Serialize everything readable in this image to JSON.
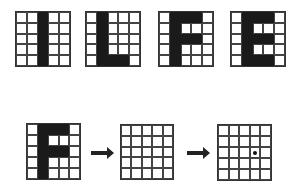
{
  "top_row": [
    {
      "letter": "I",
      "pattern": [
        "00100",
        "00100",
        "00100",
        "00100",
        "00100"
      ]
    },
    {
      "letter": "L",
      "pattern": [
        "01000",
        "01000",
        "01000",
        "01000",
        "01110"
      ]
    },
    {
      "letter": "F",
      "pattern": [
        "01110",
        "01000",
        "01110",
        "01000",
        "01000"
      ]
    },
    {
      "letter": "E",
      "pattern": [
        "01110",
        "01000",
        "01110",
        "01000",
        "01110"
      ]
    }
  ],
  "bottom_row": {
    "input": {
      "letter": "F",
      "pattern": [
        "01110",
        "01000",
        "01110",
        "01000",
        "01000"
      ]
    },
    "blank": {
      "pattern": [
        "00000",
        "00000",
        "00000",
        "00000",
        "00000"
      ]
    },
    "output": {
      "pattern": [
        "00000",
        "00000",
        "00000",
        "00000",
        "00000"
      ],
      "dot_cell": {
        "row": 2,
        "col": 3
      }
    },
    "arrows": [
      "arrow-right",
      "arrow-right"
    ]
  }
}
